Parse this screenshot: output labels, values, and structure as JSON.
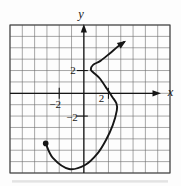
{
  "figure": {
    "background": "#fdfdfd",
    "ink": "#161616",
    "grid_color": "#6b6b6b",
    "border_color": "#454545",
    "shadow_color": "#d7d7d7"
  },
  "chart_data": {
    "type": "line",
    "title": "",
    "xlabel": "x",
    "ylabel": "y",
    "grid": true,
    "grid_cols": 13,
    "grid_rows": 13,
    "origin_col": 6,
    "origin_row": 6,
    "unit_per_cell": 1,
    "xlim": [
      -6,
      7
    ],
    "ylim": [
      -7,
      6
    ],
    "xticks": [
      {
        "value": -2,
        "label": "−2",
        "label_dx": -4,
        "label_dy": 15
      },
      {
        "value": 2,
        "label": "2",
        "label_dx": -7,
        "label_dy": 9
      }
    ],
    "yticks": [
      {
        "value": 2,
        "label": "2",
        "label_dx": -8,
        "label_dy": 3.5
      },
      {
        "value": -2,
        "label": "−2",
        "label_dx": -6,
        "label_dy": 5
      }
    ],
    "curve": {
      "start_marker": "dot",
      "end_marker": "arrow",
      "points": [
        [
          -3.1,
          -4.4
        ],
        [
          -2.5,
          -5.7
        ],
        [
          -1.2,
          -6.65
        ],
        [
          0.1,
          -6.3
        ],
        [
          1.1,
          -5.3
        ],
        [
          1.8,
          -4.1
        ],
        [
          2.35,
          -2.8
        ],
        [
          2.68,
          -1.5
        ],
        [
          2.65,
          -0.9
        ],
        [
          2.3,
          -0.3
        ],
        [
          1.9,
          0.35
        ],
        [
          1.3,
          1.3
        ],
        [
          0.75,
          1.85
        ],
        [
          0.57,
          2.1
        ],
        [
          0.75,
          2.5
        ],
        [
          1.35,
          2.85
        ],
        [
          2.1,
          3.5
        ],
        [
          2.75,
          4.1
        ],
        [
          3.27,
          4.5
        ]
      ]
    }
  }
}
